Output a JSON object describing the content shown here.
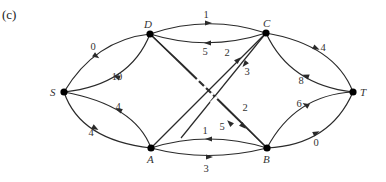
{
  "panel_label": "(c)",
  "colors": {
    "edge": "#2a2a2a",
    "node": "#000000",
    "text": "#333333"
  },
  "nodes": [
    {
      "id": "S",
      "x": 64,
      "y": 92,
      "lx": 50,
      "ly": 96
    },
    {
      "id": "D",
      "x": 150,
      "y": 34,
      "lx": 144,
      "ly": 28
    },
    {
      "id": "C",
      "x": 266,
      "y": 33,
      "lx": 263,
      "ly": 27
    },
    {
      "id": "T",
      "x": 353,
      "y": 92,
      "lx": 360,
      "ly": 96
    },
    {
      "id": "A",
      "x": 151,
      "y": 148,
      "lx": 147,
      "ly": 163
    },
    {
      "id": "B",
      "x": 267,
      "y": 148,
      "lx": 263,
      "ly": 163
    }
  ],
  "edges": [
    {
      "from": "S",
      "to": "D",
      "capacity": "0",
      "path": "M64,92 Q95,40 150,34",
      "arrow": [
        96,
        56,
        35
      ],
      "lx": 93,
      "ly": 50
    },
    {
      "from": "D",
      "to": "S",
      "capacity": "10",
      "path": "M150,34 Q130,85 64,92",
      "arrow": [
        117,
        77,
        200
      ],
      "lx": 117,
      "ly": 80
    },
    {
      "from": "S",
      "to": "A",
      "capacity": "4",
      "path": "M64,92 Q80,140 151,148",
      "arrow": [
        95,
        128,
        30
      ],
      "lx": 91,
      "ly": 136
    },
    {
      "from": "A",
      "to": "S",
      "capacity": "4",
      "path": "M151,148 Q135,105 64,92",
      "arrow": [
        119,
        110,
        205
      ],
      "lx": 118,
      "ly": 110
    },
    {
      "from": "D",
      "to": "C",
      "capacity": "1",
      "path": "M150,34 Q208,14 266,33",
      "arrow": [
        208,
        23,
        0
      ],
      "lx": 206,
      "ly": 18
    },
    {
      "from": "C",
      "to": "D",
      "capacity": "5",
      "path": "M266,33 Q208,52 150,34",
      "arrow": [
        208,
        43,
        180
      ],
      "lx": 205,
      "ly": 55
    },
    {
      "from": "A",
      "to": "C",
      "capacity": "2",
      "path": "M151,148 L266,33",
      "arrow": [
        238,
        60,
        -45
      ],
      "lx": 227,
      "ly": 56
    },
    {
      "from": "C",
      "to": "A",
      "capacity": "3",
      "path": "M266,33 L181,138",
      "arrow": [
        245,
        64,
        129
      ],
      "lx": 247,
      "ly": 75
    },
    {
      "from": "D",
      "to": "B",
      "capacity": "2",
      "path": "M150,34 L267,148",
      "arrow": [
        243,
        126,
        45
      ],
      "lx": 245,
      "ly": 111
    },
    {
      "from": "B",
      "to": "D",
      "capacity": "5",
      "path": "M267,148 Q210,90 150,34",
      "arrow": [
        230,
        123,
        225
      ],
      "lx": 222,
      "ly": 130
    },
    {
      "from": "B",
      "to": "A",
      "capacity": "1",
      "path": "M267,148 Q208,130 151,148",
      "arrow": [
        209,
        139,
        180
      ],
      "lx": 205,
      "ly": 134
    },
    {
      "from": "A",
      "to": "B",
      "capacity": "3",
      "path": "M151,148 Q208,163 267,148",
      "arrow": [
        209,
        157,
        0
      ],
      "lx": 206,
      "ly": 172
    },
    {
      "from": "C",
      "to": "T",
      "capacity": "4",
      "path": "M266,33 Q335,45 353,92",
      "arrow": [
        316,
        48,
        25
      ],
      "lx": 323,
      "ly": 51
    },
    {
      "from": "T",
      "to": "C",
      "capacity": "8",
      "path": "M353,92 Q290,85 266,33",
      "arrow": [
        306,
        76,
        200
      ],
      "lx": 301,
      "ly": 84
    },
    {
      "from": "T",
      "to": "B",
      "capacity": "6",
      "path": "M353,92 Q295,95 267,148",
      "arrow": [
        306,
        105,
        210
      ],
      "lx": 299,
      "ly": 107
    },
    {
      "from": "B",
      "to": "T",
      "capacity": "0",
      "path": "M267,148 Q330,145 353,92",
      "arrow": [
        316,
        133,
        -25
      ],
      "lx": 316,
      "ly": 146
    }
  ]
}
